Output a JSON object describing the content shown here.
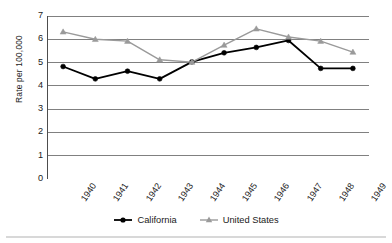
{
  "chart_data": {
    "type": "line",
    "title": "",
    "xlabel": "",
    "ylabel": "Rate per 100,000",
    "categories": [
      "1940",
      "1941",
      "1942",
      "1943",
      "1944",
      "1945",
      "1946",
      "1947",
      "1948",
      "1949"
    ],
    "ylim": [
      0,
      7
    ],
    "yticks": [
      0,
      1,
      2,
      3,
      4,
      5,
      6,
      7
    ],
    "ytick_labels": [
      "0",
      "1",
      "2",
      "3",
      "4",
      "5",
      "6",
      "7"
    ],
    "grid": "horizontal",
    "legend_position": "bottom-center",
    "series": [
      {
        "name": "California",
        "color": "#000000",
        "marker": "circle",
        "values": [
          4.83,
          4.3,
          4.63,
          4.3,
          5.03,
          5.42,
          5.65,
          5.95,
          4.75,
          4.75
        ]
      },
      {
        "name": "United States",
        "color": "#9a9a9a",
        "marker": "triangle",
        "values": [
          6.32,
          6.0,
          5.92,
          5.12,
          5.02,
          5.75,
          6.45,
          6.1,
          5.92,
          5.45
        ]
      }
    ]
  },
  "axis": {
    "y_title": "Rate per 100,000"
  },
  "legend": {
    "items": [
      {
        "label": "California"
      },
      {
        "label": "United States"
      }
    ]
  },
  "colors": {
    "california": "#000000",
    "united_states": "#9a9a9a",
    "gridline": "#808080",
    "axis": "#4d4d4d",
    "background": "#ffffff",
    "bottom_rule": "#d8d8d8"
  }
}
